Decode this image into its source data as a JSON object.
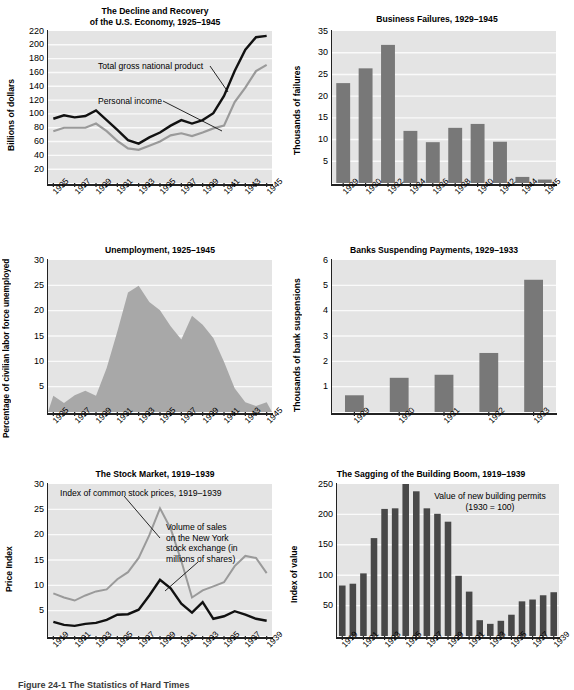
{
  "figure": {
    "caption": "Figure 24-1  The Statistics of Hard Times"
  },
  "charts": [
    {
      "id": "gnp",
      "title": "The Decline and Recovery\nof the U.S. Economy, 1925–1945",
      "title_line1": "The Decline and Recovery",
      "title_line2": "of the U.S. Economy, 1925–1945",
      "ylabel": "Billions of dollars",
      "annotations": [
        "Total gross national product",
        "Personal income"
      ]
    },
    {
      "id": "failures",
      "title": "Business Failures, 1929–1945",
      "ylabel": "Thousands of failures"
    },
    {
      "id": "unemployment",
      "title": "Unemployment, 1925–1945",
      "ylabel": "Percentage of civilian labor force unemployed"
    },
    {
      "id": "banks",
      "title": "Banks Suspending Payments, 1929–1933",
      "ylabel": "Thousands of bank suspensions"
    },
    {
      "id": "stocks",
      "title": "The Stock Market, 1919–1939",
      "ylabel": "Price Index",
      "annotations": [
        "Index of common stock prices, 1919–1939",
        "Volume of sales\non the New York\nstock exchange (in\nmillions of shares)"
      ],
      "annotation_1": "Index of common stock prices, 1919–1939",
      "annotation_2_l1": "Volume of sales",
      "annotation_2_l2": "on the New York",
      "annotation_2_l3": "stock exchange (in",
      "annotation_2_l4": "millions of shares)"
    },
    {
      "id": "building",
      "title": "The Sagging of the Building Boom, 1919–1939",
      "ylabel": "Index of value",
      "annotation_l1": "Value of new building permits",
      "annotation_l2": "(1930 = 100)"
    }
  ],
  "chart_data": [
    {
      "type": "line",
      "id": "gnp",
      "title": "The Decline and Recovery of the U.S. Economy, 1925–1945",
      "xlabel": "",
      "ylabel": "Billions of dollars",
      "ylim": [
        0,
        220
      ],
      "yticks": [
        20,
        40,
        60,
        80,
        100,
        120,
        140,
        160,
        180,
        200,
        220
      ],
      "x": [
        1925,
        1926,
        1927,
        1928,
        1929,
        1930,
        1931,
        1932,
        1933,
        1934,
        1935,
        1936,
        1937,
        1938,
        1939,
        1940,
        1941,
        1942,
        1943,
        1944,
        1945
      ],
      "xticklabels": [
        "1925",
        "",
        "1927",
        "",
        "1929",
        "",
        "1931",
        "",
        "1933",
        "",
        "1935",
        "",
        "1937",
        "",
        "1939",
        "",
        "1941",
        "",
        "1943",
        "",
        "1945"
      ],
      "grid": true,
      "legend": "annotations",
      "series": [
        {
          "name": "Total gross national product",
          "color": "#111111",
          "values": [
            93,
            98,
            95,
            97,
            105,
            91,
            77,
            62,
            57,
            66,
            73,
            83,
            91,
            86,
            91,
            101,
            126,
            162,
            193,
            211,
            213
          ]
        },
        {
          "name": "Personal income",
          "color": "#9a9a9a",
          "values": [
            75,
            80,
            80,
            80,
            86,
            75,
            61,
            50,
            48,
            54,
            60,
            69,
            72,
            68,
            73,
            79,
            83,
            117,
            138,
            162,
            171
          ]
        }
      ]
    },
    {
      "type": "bar",
      "id": "failures",
      "title": "Business Failures, 1929–1945",
      "xlabel": "",
      "ylabel": "Thousands of failures",
      "ylim": [
        0,
        35
      ],
      "yticks": [
        5,
        10,
        15,
        20,
        25,
        30,
        35
      ],
      "categories": [
        "1929",
        "1930",
        "1932",
        "1934",
        "1936",
        "1938",
        "1940",
        "1942",
        "1944",
        "1945"
      ],
      "values": [
        23.0,
        26.4,
        31.8,
        12.0,
        9.4,
        12.7,
        13.6,
        9.5,
        1.4,
        0.8
      ],
      "grid": true,
      "bar_color": "#787878"
    },
    {
      "type": "area",
      "id": "unemployment",
      "title": "Unemployment, 1925–1945",
      "xlabel": "",
      "ylabel": "Percentage of civilian labor force unemployed",
      "ylim": [
        0,
        30
      ],
      "yticks": [
        5,
        10,
        15,
        20,
        25,
        30
      ],
      "x": [
        1925,
        1926,
        1927,
        1928,
        1929,
        1930,
        1931,
        1932,
        1933,
        1934,
        1935,
        1936,
        1937,
        1938,
        1939,
        1940,
        1941,
        1942,
        1943,
        1944,
        1945
      ],
      "xticklabels": [
        "1925",
        "",
        "1927",
        "",
        "1929",
        "",
        "1931",
        "",
        "1933",
        "",
        "1935",
        "",
        "1937",
        "",
        "1939",
        "",
        "1941",
        "",
        "1943",
        "",
        "1945"
      ],
      "values": [
        3.2,
        1.8,
        3.3,
        4.2,
        3.2,
        8.7,
        15.9,
        23.6,
        24.9,
        21.7,
        20.1,
        16.9,
        14.3,
        19.0,
        17.2,
        14.6,
        9.9,
        4.7,
        1.9,
        1.2,
        1.9
      ],
      "grid": true,
      "area_color": "#a8a8a8"
    },
    {
      "type": "bar",
      "id": "banks",
      "title": "Banks Suspending Payments, 1929–1933",
      "xlabel": "",
      "ylabel": "Thousands of bank suspensions",
      "ylim": [
        0,
        6
      ],
      "yticks": [
        1,
        2,
        3,
        4,
        5,
        6
      ],
      "categories": [
        "1929",
        "1930",
        "1931",
        "1932",
        "1933"
      ],
      "values": [
        0.66,
        1.35,
        1.47,
        2.33,
        5.22
      ],
      "grid": true,
      "bar_color": "#787878"
    },
    {
      "type": "line",
      "id": "stocks",
      "title": "The Stock Market, 1919–1939",
      "xlabel": "",
      "ylabel": "Price Index",
      "ylim": [
        0,
        30
      ],
      "yticks": [
        5,
        10,
        15,
        20,
        25,
        30
      ],
      "x": [
        1919,
        1920,
        1921,
        1922,
        1923,
        1924,
        1925,
        1926,
        1927,
        1928,
        1929,
        1930,
        1931,
        1932,
        1933,
        1934,
        1935,
        1936,
        1937,
        1938,
        1939
      ],
      "xticklabels": [
        "1919",
        "",
        "1921",
        "",
        "1923",
        "",
        "1925",
        "",
        "1927",
        "",
        "1929",
        "",
        "1931",
        "",
        "1933",
        "",
        "1935",
        "",
        "1937",
        "",
        "1939"
      ],
      "grid": true,
      "series": [
        {
          "name": "Index of common stock prices, 1919–1939",
          "color": "#9a9a9a",
          "values": [
            8.4,
            7.6,
            7.0,
            8.0,
            8.8,
            9.2,
            11.2,
            12.6,
            15.4,
            19.9,
            25.2,
            21.2,
            14.8,
            7.6,
            9.0,
            9.8,
            10.6,
            13.8,
            15.8,
            15.4,
            12.4
          ]
        },
        {
          "name": "Volume of sales on the New York stock exchange (in millions of shares)",
          "color": "#111111",
          "values": [
            2.8,
            2.2,
            2.0,
            2.4,
            2.6,
            3.2,
            4.2,
            4.3,
            5.2,
            8.0,
            11.1,
            9.4,
            6.4,
            4.6,
            6.7,
            3.4,
            3.9,
            4.9,
            4.2,
            3.4,
            3.0
          ]
        }
      ]
    },
    {
      "type": "bar",
      "id": "building",
      "title": "The Sagging of the Building Boom, 1919–1939",
      "xlabel": "",
      "ylabel": "Index of value",
      "ylim": [
        0,
        250
      ],
      "yticks": [
        50,
        100,
        150,
        200,
        250
      ],
      "categories": [
        "1919",
        "1920",
        "1921",
        "1922",
        "1923",
        "1924",
        "1925",
        "1926",
        "1927",
        "1928",
        "1929",
        "1930",
        "1931",
        "1932",
        "1933",
        "1934",
        "1935",
        "1936",
        "1937",
        "1938",
        "1939"
      ],
      "xticklabels": [
        "1919",
        "",
        "1921",
        "",
        "1923",
        "",
        "1925",
        "",
        "1927",
        "",
        "1929",
        "",
        "1931",
        "",
        "1933",
        "",
        "1935",
        "",
        "1937",
        "",
        "1939"
      ],
      "values": [
        83,
        86,
        103,
        161,
        209,
        210,
        250,
        238,
        210,
        201,
        188,
        99,
        73,
        26,
        20,
        25,
        35,
        57,
        60,
        67,
        72
      ],
      "grid": true,
      "bar_color": "#484848",
      "annotation": "Value of new building permits (1930 = 100)"
    }
  ]
}
